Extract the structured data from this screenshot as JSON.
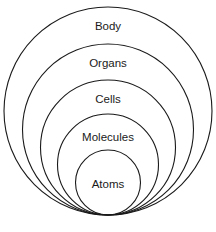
{
  "diagram": {
    "type": "nested-circles",
    "stroke_color": "#1a1a1a",
    "background": "#ffffff",
    "levels": [
      {
        "label": "Body",
        "cx": 108,
        "cy": 111,
        "r": 104,
        "label_y": 27
      },
      {
        "label": "Organs",
        "cx": 108,
        "cy": 129.5,
        "r": 85.5,
        "label_y": 64
      },
      {
        "label": "Cells",
        "cx": 108,
        "cy": 147.5,
        "r": 67.5,
        "label_y": 100
      },
      {
        "label": "Molecules",
        "cx": 108,
        "cy": 164.5,
        "r": 50.5,
        "label_y": 138
      },
      {
        "label": "Atoms",
        "cx": 108,
        "cy": 182.5,
        "r": 32.5,
        "label_y": 185
      }
    ]
  }
}
